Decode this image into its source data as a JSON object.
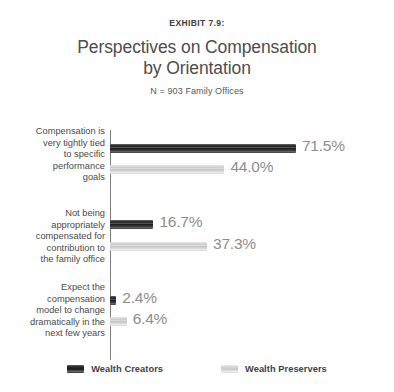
{
  "header": {
    "exhibit_label": "EXHIBIT 7.9:",
    "title_line1": "Perspectives on Compensation",
    "title_line2": "by Orientation",
    "subtitle": "N = 903 Family Offices"
  },
  "legend": {
    "items": [
      {
        "label": "Wealth Creators",
        "color": "#1f1f1f"
      },
      {
        "label": "Wealth Preservers",
        "color": "#d2d2d2"
      }
    ]
  },
  "categories": [
    {
      "lines": "Compensation is\nvery tightly tied\nto specific\nperformance\ngoals",
      "creators_label": "71.5%",
      "preservers_label": "44.0%"
    },
    {
      "lines": "Not being\nappropriately\ncompensated for\ncontribution to\nthe family office",
      "creators_label": "16.7%",
      "preservers_label": "37.3%"
    },
    {
      "lines": "Expect the\ncompensation\nmodel to change\ndramatically in the\nnext few years",
      "creators_label": "2.4%",
      "preservers_label": "6.4%"
    }
  ],
  "chart_data": {
    "type": "bar",
    "orientation": "horizontal",
    "title": "Perspectives on Compensation by Orientation",
    "subtitle": "N = 903 Family Offices",
    "exhibit": "EXHIBIT 7.9:",
    "xlabel": "",
    "ylabel": "",
    "xlim": [
      0,
      80
    ],
    "grid": false,
    "legend_position": "bottom",
    "value_suffix": "%",
    "categories": [
      "Compensation is very tightly tied to specific performance goals",
      "Not being appropriately compensated for contribution to the family office",
      "Expect the compensation model to change dramatically in the next few years"
    ],
    "series": [
      {
        "name": "Wealth Creators",
        "color": "#1f1f1f",
        "values": [
          71.5,
          16.7,
          2.4
        ]
      },
      {
        "name": "Wealth Preservers",
        "color": "#d2d2d2",
        "values": [
          44.0,
          37.3,
          6.4
        ]
      }
    ],
    "px_per_percent": 2.6
  }
}
